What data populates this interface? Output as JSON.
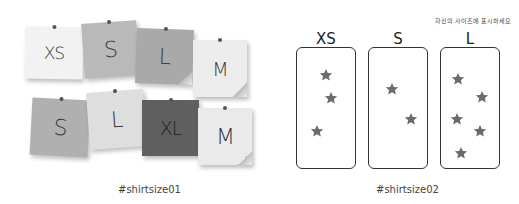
{
  "left_panel": {
    "caption": "#shirtsize01",
    "notes": [
      {
        "letter": "XS",
        "x": 25,
        "y": 27,
        "w": 58,
        "h": 52,
        "rot": 1,
        "bg": "#f2f2f2",
        "size": 17,
        "curl": false
      },
      {
        "letter": "S",
        "x": 83,
        "y": 22,
        "w": 55,
        "h": 55,
        "rot": -4,
        "bg": "#b9b9b9",
        "size": 22,
        "curl": false
      },
      {
        "letter": "L",
        "x": 136,
        "y": 29,
        "w": 57,
        "h": 55,
        "rot": 2,
        "bg": "#a9a9a9",
        "size": 22,
        "curl": true
      },
      {
        "letter": "M",
        "x": 193,
        "y": 40,
        "w": 54,
        "h": 57,
        "rot": 0,
        "bg": "#ececec",
        "size": 19,
        "curl": true
      },
      {
        "letter": "S",
        "x": 31,
        "y": 99,
        "w": 58,
        "h": 57,
        "rot": 3,
        "bg": "#b0b0b0",
        "size": 22,
        "curl": false
      },
      {
        "letter": "L",
        "x": 88,
        "y": 91,
        "w": 57,
        "h": 57,
        "rot": -4,
        "bg": "#dedede",
        "size": 22,
        "curl": false
      },
      {
        "letter": "XL",
        "x": 142,
        "y": 100,
        "w": 57,
        "h": 56,
        "rot": 0,
        "bg": "#5f5f5f",
        "size": 19,
        "curl": false
      },
      {
        "letter": "M",
        "x": 198,
        "y": 108,
        "w": 54,
        "h": 57,
        "rot": 0,
        "bg": "#eaeaea",
        "size": 22,
        "curl": true
      }
    ]
  },
  "right_panel": {
    "hint": "자신의 사이즈에 표시하세요",
    "caption": "#shirtsize02",
    "star_color": "#6b6b6b",
    "boxes": [
      {
        "label": "XS",
        "x": 296,
        "stars": [
          [
            29,
            27
          ],
          [
            34,
            50
          ],
          [
            20,
            83
          ]
        ]
      },
      {
        "label": "S",
        "x": 368,
        "stars": [
          [
            23,
            41
          ],
          [
            42,
            71
          ]
        ]
      },
      {
        "label": "L",
        "x": 440,
        "stars": [
          [
            17,
            31
          ],
          [
            41,
            49
          ],
          [
            16,
            71
          ],
          [
            39,
            83
          ],
          [
            20,
            105
          ]
        ]
      }
    ]
  }
}
